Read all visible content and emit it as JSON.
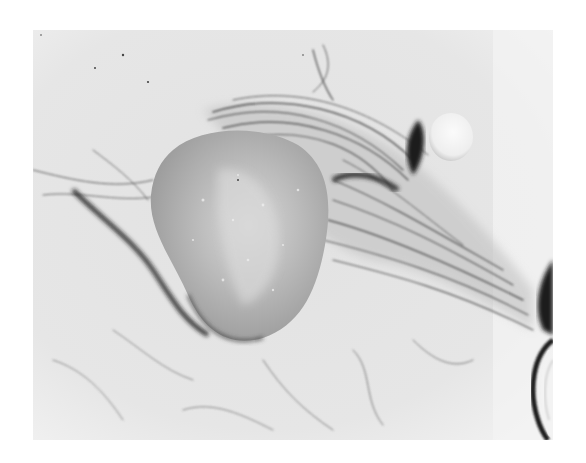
{
  "image": {
    "kind": "black-and-white clinical photograph",
    "frame": {
      "x": 33,
      "y": 30,
      "width": 520,
      "height": 410
    },
    "colors": {
      "page_background": "#ffffff",
      "skin_light": "#e6e6e6",
      "skin_mid": "#cfcfcf",
      "mass_fill": "#a9a9a9",
      "mass_highlight": "#d8d8d8",
      "shadow_dark": "#1e1e1e",
      "hair_stroke": "#5a5a5a"
    },
    "subjects": [
      {
        "name": "rounded-mass",
        "description": "large oval swelling, centre-left"
      },
      {
        "name": "hair-strands",
        "description": "dark curved hair strands fanning right"
      },
      {
        "name": "small-nodule",
        "description": "small bright round nodule, upper right"
      },
      {
        "name": "right-edge-contour",
        "description": "dark curved contour at lower right edge"
      }
    ]
  }
}
